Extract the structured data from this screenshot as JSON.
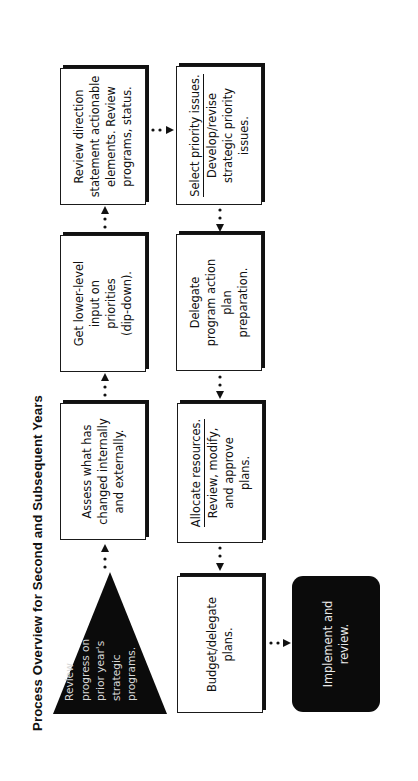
{
  "title": "Process Overview for Second and Subsequent Years",
  "colors": {
    "background": "#ffffff",
    "box_fill": "#ffffff",
    "box_border": "#1a1a1a",
    "dark_fill": "#0b0b0b",
    "dark_text": "#e8e8e8"
  },
  "start": {
    "shape": "triangle",
    "lines": [
      "Review",
      "progress on",
      "prior year's",
      "strategic",
      "programs."
    ]
  },
  "steps": {
    "assess": {
      "lines": [
        "Assess what has",
        "changed internally",
        "and externally."
      ]
    },
    "lower_level": {
      "lines": [
        "Get lower-level",
        "input on",
        "priorities",
        "(dip-down)."
      ]
    },
    "review_direction": {
      "lines": [
        "Review direction",
        "statement actionable",
        "elements.  Review",
        "programs, status."
      ]
    },
    "select_priority": {
      "heading": "Select priority issues.",
      "lines": [
        "Develop/revise",
        "strategic priority",
        "issues."
      ]
    },
    "delegate": {
      "lines": [
        "Delegate",
        "program action",
        "plan",
        "preparation."
      ]
    },
    "allocate": {
      "heading": "Allocate resources.",
      "lines": [
        "Review, modify,",
        "and approve",
        "plans."
      ]
    },
    "budget": {
      "lines": [
        "Budget/delegate",
        "plans."
      ]
    }
  },
  "end": {
    "shape": "rounded-rectangle",
    "lines": [
      "Implement and",
      "review."
    ]
  },
  "flow": [
    "Review progress on prior year's strategic programs.",
    "Assess what has changed internally and externally.",
    "Get lower-level input on priorities (dip-down).",
    "Review direction statement actionable elements. Review programs, status.",
    "Select priority issues. Develop/revise strategic priority issues.",
    "Delegate program action plan preparation.",
    "Allocate resources. Review, modify, and approve plans.",
    "Budget/delegate plans.",
    "Implement and review."
  ]
}
